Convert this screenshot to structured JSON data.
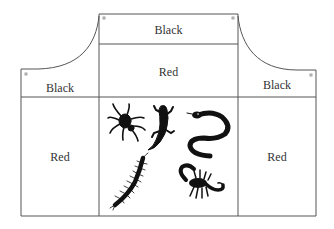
{
  "diagram": {
    "regions": {
      "bib_top": "Black",
      "bib_middle": "Red",
      "left_top": "Black",
      "left_bottom": "Red",
      "right_top": "Black",
      "right_bottom": "Red"
    },
    "center_motifs": [
      "spider-icon",
      "lizard-icon",
      "snake-icon",
      "centipede-icon",
      "scorpion-icon"
    ],
    "colors": {
      "line": "#555555",
      "text": "#333333",
      "motif": "#111111",
      "background": "#ffffff"
    }
  }
}
